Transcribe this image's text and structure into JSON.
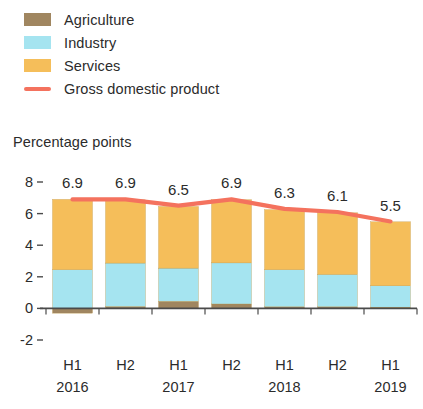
{
  "axis_caption": "Percentage points",
  "legend": {
    "items": [
      {
        "label": "Agriculture",
        "color": "#a08660",
        "type": "swatch",
        "icon": "legend-swatch-agriculture"
      },
      {
        "label": "Industry",
        "color": "#a5e4f0",
        "type": "swatch",
        "icon": "legend-swatch-industry"
      },
      {
        "label": "Services",
        "color": "#f5be5a",
        "type": "swatch",
        "icon": "legend-swatch-services"
      },
      {
        "label": "Gross domestic product",
        "color": "#f4725e",
        "type": "line",
        "icon": "legend-line-gdp"
      }
    ]
  },
  "x_axis": {
    "periods": [
      "H1",
      "H2",
      "H1",
      "H2",
      "H1",
      "H2",
      "H1"
    ],
    "years": [
      {
        "label": "2016",
        "at_index": 0
      },
      {
        "label": "2017",
        "at_index": 2
      },
      {
        "label": "2018",
        "at_index": 4
      },
      {
        "label": "2019",
        "at_index": 6
      }
    ]
  },
  "chart_data": {
    "type": "bar",
    "subtype": "stacked-bar-with-line-overlay",
    "title": "",
    "subtitle": "",
    "xlabel": "",
    "ylabel": "Percentage points",
    "ylim": [
      -2,
      8
    ],
    "yticks": [
      8,
      6,
      4,
      2,
      0,
      -2
    ],
    "ytick_labels": [
      "8",
      "6",
      "4",
      "2",
      "0",
      "-2"
    ],
    "grid": false,
    "legend_position": "top-left",
    "categories": [
      "H1 2016",
      "H2 2016",
      "H1 2017",
      "H2 2017",
      "H1 2018",
      "H2 2018",
      "H1 2019"
    ],
    "series": [
      {
        "name": "Agriculture",
        "color": "#a08660",
        "values": [
          -0.3,
          0.12,
          0.45,
          0.28,
          0.1,
          0.1,
          0.08
        ]
      },
      {
        "name": "Industry",
        "color": "#a5e4f0",
        "values": [
          2.45,
          2.75,
          2.1,
          2.6,
          2.35,
          2.05,
          1.35
        ]
      },
      {
        "name": "Services",
        "color": "#f5be5a",
        "values": [
          4.45,
          4.0,
          3.9,
          4.0,
          3.8,
          3.9,
          4.05
        ]
      }
    ],
    "overlay_series": {
      "name": "Gross domestic product",
      "type": "line",
      "color": "#f4725e",
      "values": [
        6.9,
        6.9,
        6.5,
        6.9,
        6.3,
        6.1,
        5.5
      ],
      "data_labels": [
        "6.9",
        "6.9",
        "6.5",
        "6.9",
        "6.3",
        "6.1",
        "5.5"
      ]
    }
  }
}
